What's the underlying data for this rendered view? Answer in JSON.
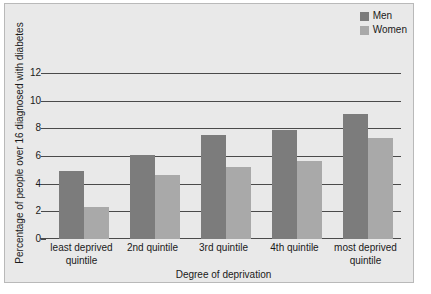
{
  "chart_data": {
    "type": "bar",
    "title": "",
    "xlabel": "Degree of deprivation",
    "ylabel": "Percentage of people over 16 diagnosed with diabetes",
    "categories": [
      "least deprived quintile",
      "2nd quintile",
      "3rd quintile",
      "4th quintile",
      "most deprived quintile"
    ],
    "series": [
      {
        "name": "Men",
        "color": "#7c7c7c",
        "values": [
          4.9,
          6.1,
          7.5,
          7.9,
          9.0
        ]
      },
      {
        "name": "Women",
        "color": "#a9a9a9",
        "values": [
          2.3,
          4.6,
          5.2,
          5.6,
          7.3
        ]
      }
    ],
    "ylim": [
      0,
      13
    ],
    "yticks": [
      0,
      2,
      4,
      6,
      8,
      10,
      12
    ],
    "grid": true,
    "legend_position": "top-right"
  },
  "legend": {
    "entries": [
      {
        "label": "Men"
      },
      {
        "label": "Women"
      }
    ]
  },
  "colors": {
    "figure_background": "#e9e9e9",
    "figure_border": "#b9b9b9",
    "axis": "#4a4a4a",
    "text": "#1a1a1a",
    "men": "#7c7c7c",
    "women": "#a9a9a9"
  }
}
